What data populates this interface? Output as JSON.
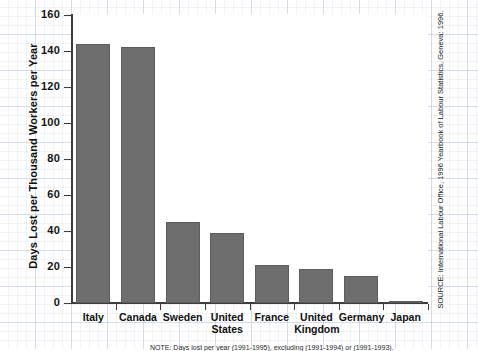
{
  "chart_data": {
    "type": "bar",
    "title": "",
    "xlabel": "",
    "ylabel": "Days Lost per Thousand Workers per Year",
    "ylim": [
      0,
      160
    ],
    "yticks": [
      0,
      20,
      40,
      60,
      80,
      100,
      120,
      140,
      160
    ],
    "grid": false,
    "legend": null,
    "categories": [
      "Italy",
      "Canada",
      "Sweden",
      "United\nStates",
      "France",
      "United\nKingdom",
      "Germany",
      "Japan"
    ],
    "values": [
      144,
      142,
      45,
      39,
      21,
      19,
      15,
      1
    ],
    "series": [
      {
        "name": "Days lost per thousand workers per year",
        "values": [
          144,
          142,
          45,
          39,
          21,
          19,
          15,
          1
        ]
      }
    ],
    "bar_color": "#6e6e6e",
    "axis_color": "#3d3d3d"
  },
  "annotations": {
    "source": "SOURCE: International Labour Office, 1996 Yearbook of Labour Statistics, Geneva: 1996.",
    "bottom_note": "NOTE: Days lost per year (1991-1995), excluding (1991-1994) or (1991-1993)."
  },
  "colors": {
    "bar": "#6e6e6e",
    "bar_edge": "#5d5d5d",
    "axis": "#3d3d3d",
    "text": "#111111",
    "grid_paper": "#96aac3",
    "background": "#ffffff"
  }
}
